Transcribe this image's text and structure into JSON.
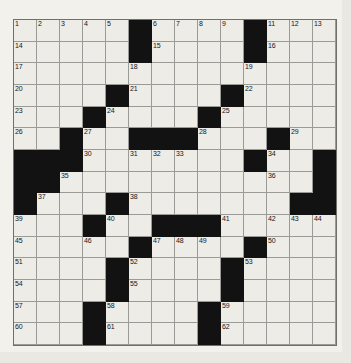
{
  "puzzle": {
    "title": "Crossword Puzzle Grid",
    "columns": 14,
    "rows": 15,
    "colors": {
      "block": "#121212",
      "cell": "#edece7",
      "grid_line": "#8a8a86",
      "page_background": "#f2f1ec",
      "number_text": "#16161a"
    },
    "grid": [
      {
        "row": 1,
        "blocks": [
          5,
          10
        ],
        "numbers": {
          "0": "1",
          "1": "2",
          "2": "3",
          "3": "4",
          "4": "5",
          "6": "6",
          "7": "7",
          "8": "8",
          "9": "9",
          "11": "11",
          "12": "12",
          "13": "13"
        }
      },
      {
        "row": 2,
        "blocks": [
          5,
          10
        ],
        "numbers": {
          "0": "14",
          "6": "15",
          "11": "16"
        }
      },
      {
        "row": 3,
        "blocks": [],
        "numbers": {
          "0": "17",
          "5": "18",
          "10": "19"
        }
      },
      {
        "row": 4,
        "blocks": [
          4,
          9
        ],
        "numbers": {
          "0": "20",
          "5": "21",
          "10": "22"
        }
      },
      {
        "row": 5,
        "blocks": [
          3,
          8
        ],
        "numbers": {
          "0": "23",
          "4": "24",
          "9": "25"
        }
      },
      {
        "row": 6,
        "blocks": [
          2,
          5,
          6,
          7,
          11
        ],
        "numbers": {
          "0": "26",
          "3": "27",
          "8": "28",
          "12": "29"
        }
      },
      {
        "row": 7,
        "blocks": [
          0,
          1,
          2,
          10,
          13
        ],
        "numbers": {
          "3": "30",
          "5": "31",
          "6": "32",
          "7": "33",
          "11": "34"
        }
      },
      {
        "row": 8,
        "blocks": [
          0,
          1,
          13
        ],
        "numbers": {
          "2": "35",
          "11": "36"
        }
      },
      {
        "row": 9,
        "blocks": [
          0,
          4,
          12,
          13
        ],
        "numbers": {
          "1": "37",
          "5": "38"
        }
      },
      {
        "row": 10,
        "blocks": [
          3,
          6,
          7,
          8
        ],
        "numbers": {
          "0": "39",
          "4": "40",
          "9": "41",
          "11": "42",
          "12": "43",
          "13": "44"
        }
      },
      {
        "row": 11,
        "blocks": [
          5,
          10
        ],
        "numbers": {
          "0": "45",
          "3": "46",
          "6": "47",
          "7": "48",
          "8": "49",
          "11": "50"
        }
      },
      {
        "row": 12,
        "blocks": [
          4,
          9
        ],
        "numbers": {
          "0": "51",
          "5": "52",
          "10": "53"
        }
      },
      {
        "row": 13,
        "blocks": [
          4,
          9
        ],
        "numbers": {
          "0": "54",
          "5": "55",
          "9": "56"
        }
      },
      {
        "row": 14,
        "blocks": [
          3,
          8
        ],
        "numbers": {
          "0": "57",
          "4": "58",
          "9": "59"
        }
      },
      {
        "row": 15,
        "blocks": [
          3,
          8
        ],
        "numbers": {
          "0": "60",
          "4": "61",
          "9": "62"
        }
      }
    ],
    "clue_numbers": [
      "1",
      "2",
      "3",
      "4",
      "5",
      "6",
      "7",
      "8",
      "9",
      "10",
      "11",
      "12",
      "13",
      "14",
      "15",
      "16",
      "17",
      "18",
      "19",
      "20",
      "21",
      "22",
      "23",
      "24",
      "25",
      "26",
      "27",
      "28",
      "29",
      "30",
      "31",
      "32",
      "33",
      "34",
      "35",
      "36",
      "37",
      "38",
      "39",
      "40",
      "41",
      "42",
      "43",
      "44",
      "45",
      "46",
      "47",
      "48",
      "49",
      "50",
      "51",
      "52",
      "53",
      "54",
      "55",
      "56",
      "57",
      "58",
      "59",
      "60",
      "61",
      "62"
    ]
  }
}
